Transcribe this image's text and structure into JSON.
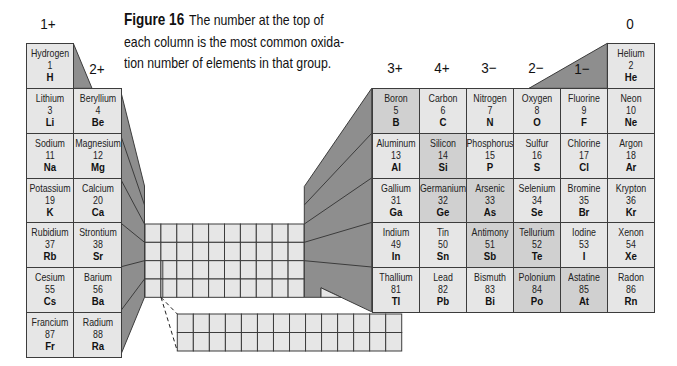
{
  "caption": {
    "label": "Figure 16",
    "line1": "The number at the top of",
    "line2": "each column is the most common oxida-",
    "line3": "tion number of elements in that group."
  },
  "oxidation_labels": [
    {
      "group": 1,
      "label": "1+"
    },
    {
      "group": 2,
      "label": "2+"
    },
    {
      "group": 13,
      "label": "3+"
    },
    {
      "group": 14,
      "label": "4+"
    },
    {
      "group": 15,
      "label": "3−"
    },
    {
      "group": 16,
      "label": "2−"
    },
    {
      "group": 17,
      "label": "1−"
    },
    {
      "group": 18,
      "label": "0"
    }
  ],
  "colors": {
    "cell": "#e6e6e6",
    "metalloid_cell": "#d0d0d0",
    "shadow": "#8e8e8e",
    "border": "#3c3c3c"
  },
  "elements": [
    {
      "name": "Hydrogen",
      "number": "1",
      "symbol": "H",
      "group": 1,
      "period": 1
    },
    {
      "name": "Helium",
      "number": "2",
      "symbol": "He",
      "group": 18,
      "period": 1
    },
    {
      "name": "Lithium",
      "number": "3",
      "symbol": "Li",
      "group": 1,
      "period": 2
    },
    {
      "name": "Beryllium",
      "number": "4",
      "symbol": "Be",
      "group": 2,
      "period": 2
    },
    {
      "name": "Boron",
      "number": "5",
      "symbol": "B",
      "group": 13,
      "period": 2,
      "metalloid": true
    },
    {
      "name": "Carbon",
      "number": "6",
      "symbol": "C",
      "group": 14,
      "period": 2
    },
    {
      "name": "Nitrogen",
      "number": "7",
      "symbol": "N",
      "group": 15,
      "period": 2
    },
    {
      "name": "Oxygen",
      "number": "8",
      "symbol": "O",
      "group": 16,
      "period": 2
    },
    {
      "name": "Fluorine",
      "number": "9",
      "symbol": "F",
      "group": 17,
      "period": 2
    },
    {
      "name": "Neon",
      "number": "10",
      "symbol": "Ne",
      "group": 18,
      "period": 2
    },
    {
      "name": "Sodium",
      "number": "11",
      "symbol": "Na",
      "group": 1,
      "period": 3
    },
    {
      "name": "Magnesium",
      "number": "12",
      "symbol": "Mg",
      "group": 2,
      "period": 3
    },
    {
      "name": "Aluminum",
      "number": "13",
      "symbol": "Al",
      "group": 13,
      "period": 3
    },
    {
      "name": "Silicon",
      "number": "14",
      "symbol": "Si",
      "group": 14,
      "period": 3,
      "metalloid": true
    },
    {
      "name": "Phosphorus",
      "number": "15",
      "symbol": "P",
      "group": 15,
      "period": 3
    },
    {
      "name": "Sulfur",
      "number": "16",
      "symbol": "S",
      "group": 16,
      "period": 3
    },
    {
      "name": "Chlorine",
      "number": "17",
      "symbol": "Cl",
      "group": 17,
      "period": 3
    },
    {
      "name": "Argon",
      "number": "18",
      "symbol": "Ar",
      "group": 18,
      "period": 3
    },
    {
      "name": "Potassium",
      "number": "19",
      "symbol": "K",
      "group": 1,
      "period": 4
    },
    {
      "name": "Calcium",
      "number": "20",
      "symbol": "Ca",
      "group": 2,
      "period": 4
    },
    {
      "name": "Gallium",
      "number": "31",
      "symbol": "Ga",
      "group": 13,
      "period": 4
    },
    {
      "name": "Germanium",
      "number": "32",
      "symbol": "Ge",
      "group": 14,
      "period": 4,
      "metalloid": true
    },
    {
      "name": "Arsenic",
      "number": "33",
      "symbol": "As",
      "group": 15,
      "period": 4,
      "metalloid": true
    },
    {
      "name": "Selenium",
      "number": "34",
      "symbol": "Se",
      "group": 16,
      "period": 4
    },
    {
      "name": "Bromine",
      "number": "35",
      "symbol": "Br",
      "group": 17,
      "period": 4
    },
    {
      "name": "Krypton",
      "number": "36",
      "symbol": "Kr",
      "group": 18,
      "period": 4
    },
    {
      "name": "Rubidium",
      "number": "37",
      "symbol": "Rb",
      "group": 1,
      "period": 5
    },
    {
      "name": "Strontium",
      "number": "38",
      "symbol": "Sr",
      "group": 2,
      "period": 5
    },
    {
      "name": "Indium",
      "number": "49",
      "symbol": "In",
      "group": 13,
      "period": 5
    },
    {
      "name": "Tin",
      "number": "50",
      "symbol": "Sn",
      "group": 14,
      "period": 5
    },
    {
      "name": "Antimony",
      "number": "51",
      "symbol": "Sb",
      "group": 15,
      "period": 5,
      "metalloid": true
    },
    {
      "name": "Tellurium",
      "number": "52",
      "symbol": "Te",
      "group": 16,
      "period": 5,
      "metalloid": true
    },
    {
      "name": "Iodine",
      "number": "53",
      "symbol": "I",
      "group": 17,
      "period": 5
    },
    {
      "name": "Xenon",
      "number": "54",
      "symbol": "Xe",
      "group": 18,
      "period": 5
    },
    {
      "name": "Cesium",
      "number": "55",
      "symbol": "Cs",
      "group": 1,
      "period": 6
    },
    {
      "name": "Barium",
      "number": "56",
      "symbol": "Ba",
      "group": 2,
      "period": 6
    },
    {
      "name": "Thallium",
      "number": "81",
      "symbol": "Tl",
      "group": 13,
      "period": 6
    },
    {
      "name": "Lead",
      "number": "82",
      "symbol": "Pb",
      "group": 14,
      "period": 6
    },
    {
      "name": "Bismuth",
      "number": "83",
      "symbol": "Bi",
      "group": 15,
      "period": 6
    },
    {
      "name": "Polonium",
      "number": "84",
      "symbol": "Po",
      "group": 16,
      "period": 6,
      "metalloid": true
    },
    {
      "name": "Astatine",
      "number": "85",
      "symbol": "At",
      "group": 17,
      "period": 6,
      "metalloid": true
    },
    {
      "name": "Radon",
      "number": "86",
      "symbol": "Rn",
      "group": 18,
      "period": 6
    },
    {
      "name": "Francium",
      "number": "87",
      "symbol": "Fr",
      "group": 1,
      "period": 7
    },
    {
      "name": "Radium",
      "number": "88",
      "symbol": "Ra",
      "group": 2,
      "period": 7
    }
  ],
  "transition_block": {
    "columns": 10,
    "rows": 4
  },
  "inner_transition_block": {
    "columns": 14,
    "rows": 2
  }
}
